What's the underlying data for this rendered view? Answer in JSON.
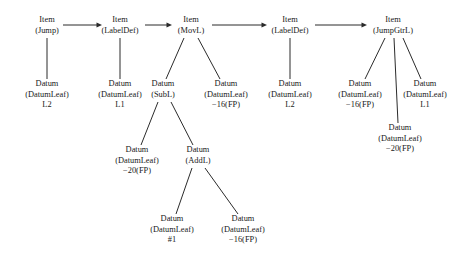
{
  "diagram": {
    "type": "tree",
    "background_color": "#ffffff",
    "line_color": "#2b2b2b",
    "text_color": "#1a1a1a",
    "nodes": [
      {
        "id": "item_jump",
        "kind": "Item",
        "label_line1": "Item",
        "label_line2": "(Jump)",
        "label_line3": "",
        "x": 47,
        "y": 22
      },
      {
        "id": "item_labeldef_1",
        "kind": "Item",
        "label_line1": "Item",
        "label_line2": "(LabelDef)",
        "label_line3": "",
        "x": 120,
        "y": 22
      },
      {
        "id": "item_movl",
        "kind": "Item",
        "label_line1": "Item",
        "label_line2": "(MovL)",
        "label_line3": "",
        "x": 191,
        "y": 22
      },
      {
        "id": "item_labeldef_2",
        "kind": "Item",
        "label_line1": "Item",
        "label_line2": "(LabelDef)",
        "label_line3": "",
        "x": 290,
        "y": 22
      },
      {
        "id": "item_jumpgtrl",
        "kind": "Item",
        "label_line1": "Item",
        "label_line2": "(JumpGtrL)",
        "label_line3": "",
        "x": 393,
        "y": 22
      },
      {
        "id": "datum_l2_a",
        "kind": "Datum",
        "label_line1": "Datum",
        "label_line2": "(DatumLeaf)",
        "label_line3": "L2",
        "x": 47,
        "y": 86
      },
      {
        "id": "datum_l1_a",
        "kind": "Datum",
        "label_line1": "Datum",
        "label_line2": "(DatumLeaf)",
        "label_line3": "L1",
        "x": 120,
        "y": 86
      },
      {
        "id": "datum_subl",
        "kind": "Datum",
        "label_line1": "Datum",
        "label_line2": "(SubL)",
        "label_line3": "",
        "x": 163,
        "y": 86
      },
      {
        "id": "datum_m16_a",
        "kind": "Datum",
        "label_line1": "Datum",
        "label_line2": "(DatumLeaf)",
        "label_line3": "−16(FP)",
        "x": 226,
        "y": 86
      },
      {
        "id": "datum_l2_b",
        "kind": "Datum",
        "label_line1": "Datum",
        "label_line2": "(DatumLeaf)",
        "label_line3": "L2",
        "x": 290,
        "y": 86
      },
      {
        "id": "datum_m16_b",
        "kind": "Datum",
        "label_line1": "Datum",
        "label_line2": "(DatumLeaf)",
        "label_line3": "−16(FP)",
        "x": 360,
        "y": 86
      },
      {
        "id": "datum_l1_b",
        "kind": "Datum",
        "label_line1": "Datum",
        "label_line2": "(DatumLeaf)",
        "label_line3": "L1",
        "x": 425,
        "y": 86
      },
      {
        "id": "datum_m20_b",
        "kind": "Datum",
        "label_line1": "Datum",
        "label_line2": "(DatumLeaf)",
        "label_line3": "−20(FP)",
        "x": 400,
        "y": 130
      },
      {
        "id": "datum_m20_a",
        "kind": "Datum",
        "label_line1": "Datum",
        "label_line2": "(DatumLeaf)",
        "label_line3": "−20(FP)",
        "x": 137,
        "y": 152
      },
      {
        "id": "datum_addl",
        "kind": "Datum",
        "label_line1": "Datum",
        "label_line2": "(AddL)",
        "label_line3": "",
        "x": 198,
        "y": 152
      },
      {
        "id": "datum_hash1",
        "kind": "Datum",
        "label_line1": "Datum",
        "label_line2": "(DatumLeaf)",
        "label_line3": "#1",
        "x": 172,
        "y": 221
      },
      {
        "id": "datum_m16_c",
        "kind": "Datum",
        "label_line1": "Datum",
        "label_line2": "(DatumLeaf)",
        "label_line3": "−16(FP)",
        "x": 243,
        "y": 221
      }
    ],
    "arrows": [
      {
        "id": "arrow_jump_to_labeldef1",
        "from": "item_jump",
        "to": "item_labeldef_1",
        "x1": 63,
        "x2": 102,
        "y": 25
      },
      {
        "id": "arrow_labeldef1_to_movl",
        "from": "item_labeldef_1",
        "to": "item_movl",
        "x1": 145,
        "x2": 172,
        "y": 25
      },
      {
        "id": "arrow_movl_to_labeldef2",
        "from": "item_movl",
        "to": "item_labeldef_2",
        "x1": 212,
        "x2": 267,
        "y": 25
      },
      {
        "id": "arrow_labeldef2_to_jumpgtrl",
        "from": "item_labeldef_2",
        "to": "item_jumpgtrl",
        "x1": 315,
        "x2": 367,
        "y": 25
      }
    ],
    "edges": [
      {
        "id": "edge_jump_l2",
        "from": "item_jump",
        "to": "datum_l2_a",
        "x1": 47,
        "y1": 38,
        "x2": 47,
        "y2": 79
      },
      {
        "id": "edge_labeldef1_l1",
        "from": "item_labeldef_1",
        "to": "datum_l1_a",
        "x1": 120,
        "y1": 38,
        "x2": 120,
        "y2": 79
      },
      {
        "id": "edge_movl_subl",
        "from": "item_movl",
        "to": "datum_subl",
        "x1": 184,
        "y1": 38,
        "x2": 166,
        "y2": 79
      },
      {
        "id": "edge_movl_m16",
        "from": "item_movl",
        "to": "datum_m16_a",
        "x1": 198,
        "y1": 38,
        "x2": 220,
        "y2": 79
      },
      {
        "id": "edge_labeldef2_l2",
        "from": "item_labeldef_2",
        "to": "datum_l2_b",
        "x1": 290,
        "y1": 38,
        "x2": 290,
        "y2": 79
      },
      {
        "id": "edge_jumpgtrl_m16",
        "from": "item_jumpgtrl",
        "to": "datum_m16_b",
        "x1": 385,
        "y1": 38,
        "x2": 365,
        "y2": 79
      },
      {
        "id": "edge_jumpgtrl_m20",
        "from": "item_jumpgtrl",
        "to": "datum_m20_b",
        "x1": 394,
        "y1": 38,
        "x2": 398,
        "y2": 123
      },
      {
        "id": "edge_jumpgtrl_l1",
        "from": "item_jumpgtrl",
        "to": "datum_l1_b",
        "x1": 403,
        "y1": 38,
        "x2": 421,
        "y2": 79
      },
      {
        "id": "edge_subl_m20",
        "from": "datum_subl",
        "to": "datum_m20_a",
        "x1": 158,
        "y1": 102,
        "x2": 141,
        "y2": 145
      },
      {
        "id": "edge_subl_addl",
        "from": "datum_subl",
        "to": "datum_addl",
        "x1": 171,
        "y1": 102,
        "x2": 193,
        "y2": 145
      },
      {
        "id": "edge_addl_hash1",
        "from": "datum_addl",
        "to": "datum_hash1",
        "x1": 192,
        "y1": 168,
        "x2": 176,
        "y2": 214
      },
      {
        "id": "edge_addl_m16",
        "from": "datum_addl",
        "to": "datum_m16_c",
        "x1": 205,
        "y1": 168,
        "x2": 238,
        "y2": 214
      }
    ]
  }
}
